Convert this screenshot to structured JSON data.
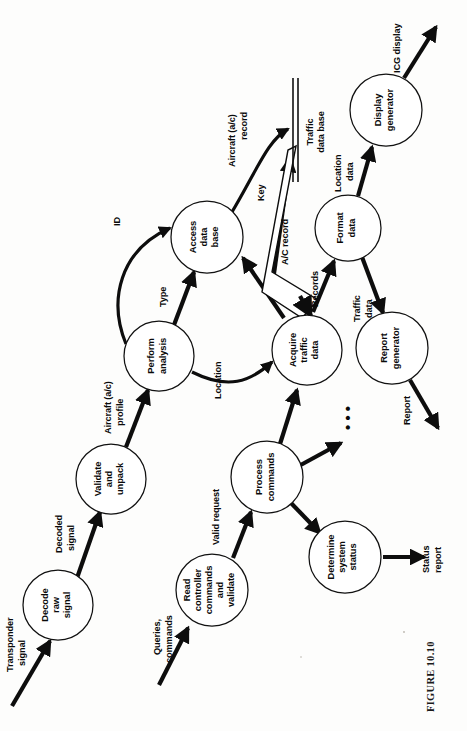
{
  "figure": {
    "caption": "FIGURE 10.10",
    "orientation": "rotated-90-ccw",
    "type": "data-flow-diagram"
  },
  "processes": [
    {
      "id": "decode-raw-signal",
      "lines": [
        "Decode",
        "raw",
        "signal"
      ],
      "cx": 58,
      "cy": 605,
      "r": 35
    },
    {
      "id": "validate-and-unpack",
      "lines": [
        "Validate",
        "and",
        "unpack"
      ],
      "cx": 111,
      "cy": 479,
      "r": 35
    },
    {
      "id": "perform-analysis",
      "lines": [
        "Perform",
        "analysis"
      ],
      "cx": 159,
      "cy": 356,
      "r": 35
    },
    {
      "id": "access-data-base",
      "lines": [
        "Access",
        "data",
        "base"
      ],
      "cx": 207,
      "cy": 237,
      "r": 36
    },
    {
      "id": "acquire-traffic-data",
      "lines": [
        "Acquire",
        "traffic",
        "data"
      ],
      "cx": 307,
      "cy": 350,
      "r": 35
    },
    {
      "id": "format-data",
      "lines": [
        "Format",
        "data"
      ],
      "cx": 348,
      "cy": 228,
      "r": 33
    },
    {
      "id": "display-generator",
      "lines": [
        "Display",
        "generator"
      ],
      "cx": 386,
      "cy": 110,
      "r": 36
    },
    {
      "id": "report-generator",
      "lines": [
        "Report",
        "generator"
      ],
      "cx": 392,
      "cy": 348,
      "r": 36
    },
    {
      "id": "read-controller-commands",
      "lines": [
        "Read",
        "controller",
        "commands",
        "and",
        "validate"
      ],
      "cx": 212,
      "cy": 590,
      "r": 36
    },
    {
      "id": "process-commands",
      "lines": [
        "Process",
        "commands"
      ],
      "cx": 267,
      "cy": 477,
      "r": 36
    },
    {
      "id": "determine-system-status",
      "lines": [
        "Determine",
        "system",
        "status"
      ],
      "cx": 345,
      "cy": 557,
      "r": 36
    }
  ],
  "data_stores": [
    {
      "id": "traffic-data-base",
      "lines": [
        "Traffic",
        "data base"
      ],
      "x": 295,
      "y1": 78,
      "y2": 182
    }
  ],
  "flows": [
    {
      "id": "transponder-signal",
      "lines": [
        "Transponder",
        "signal"
      ]
    },
    {
      "id": "decoded-signal",
      "lines": [
        "Decoded",
        "signal"
      ]
    },
    {
      "id": "aircraft-ac-profile",
      "lines": [
        "Aircraft (a/c)",
        "profile"
      ]
    },
    {
      "id": "type",
      "lines": [
        "Type"
      ]
    },
    {
      "id": "id",
      "lines": [
        "ID"
      ]
    },
    {
      "id": "aircraft-ac-record",
      "lines": [
        "Aircraft (a/c)",
        "record"
      ]
    },
    {
      "id": "location",
      "lines": [
        "Location"
      ]
    },
    {
      "id": "key",
      "lines": [
        "Key"
      ]
    },
    {
      "id": "ac-record",
      "lines": [
        "A/C record"
      ]
    },
    {
      "id": "records",
      "lines": [
        "Records"
      ]
    },
    {
      "id": "location-data",
      "lines": [
        "Location",
        "data"
      ]
    },
    {
      "id": "icg-display",
      "lines": [
        "ICG display"
      ]
    },
    {
      "id": "traffic-data",
      "lines": [
        "Traffic",
        "data"
      ]
    },
    {
      "id": "report",
      "lines": [
        "Report"
      ]
    },
    {
      "id": "queries-commands",
      "lines": [
        "Queries,",
        "commands"
      ]
    },
    {
      "id": "valid-request",
      "lines": [
        "Valid  request"
      ]
    },
    {
      "id": "status-report",
      "lines": [
        "Status",
        "report"
      ]
    },
    {
      "id": "ellipsis",
      "lines": [
        "• • •"
      ]
    }
  ],
  "colors": {
    "ink": "#0a0a0a",
    "paper": "#fdfdfc",
    "stroke": "#111111"
  }
}
